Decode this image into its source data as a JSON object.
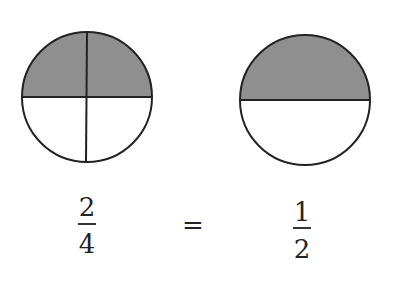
{
  "left_circle": {
    "parts": 4,
    "shaded": 2,
    "fill": "#8f8f8f"
  },
  "right_circle": {
    "parts": 2,
    "shaded": 1,
    "fill": "#8f8f8f"
  },
  "left_fraction": {
    "numerator": "2",
    "denominator": "4"
  },
  "equals": "=",
  "right_fraction": {
    "numerator": "1",
    "denominator": "2"
  }
}
